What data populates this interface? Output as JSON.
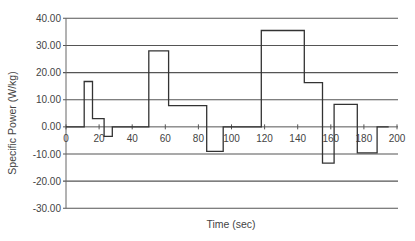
{
  "chart_data": {
    "type": "line",
    "subtype": "step",
    "title": "",
    "xlabel": "Time (sec)",
    "ylabel": "Specific Power (W/kg)",
    "xlim": [
      0,
      200
    ],
    "ylim": [
      -30,
      40
    ],
    "x_ticks": [
      0,
      20,
      40,
      60,
      80,
      100,
      120,
      140,
      160,
      180,
      200
    ],
    "x_tick_labels": [
      "0",
      "20",
      "40",
      "60",
      "80",
      "100",
      "120",
      "140",
      "160",
      "180",
      "200"
    ],
    "y_ticks": [
      40,
      30,
      20,
      10,
      0,
      -10,
      -20,
      -30
    ],
    "y_tick_labels": [
      "40.00",
      "30.00",
      "20.00",
      "10.00",
      "0.00",
      "-10.00",
      "-20.00",
      "-30.00"
    ],
    "grid": {
      "horizontal": true,
      "vertical": false
    },
    "legend": null,
    "line_color": "#333333",
    "series": [
      {
        "name": "Specific Power",
        "segments": [
          {
            "t_start": 0,
            "t_end": 11,
            "value": 0
          },
          {
            "t_start": 11,
            "t_end": 16,
            "value": 16.7
          },
          {
            "t_start": 16,
            "t_end": 23,
            "value": 3.0
          },
          {
            "t_start": 23,
            "t_end": 28,
            "value": -3.5
          },
          {
            "t_start": 28,
            "t_end": 50,
            "value": 0
          },
          {
            "t_start": 50,
            "t_end": 62,
            "value": 28.0
          },
          {
            "t_start": 62,
            "t_end": 85,
            "value": 7.8
          },
          {
            "t_start": 85,
            "t_end": 95,
            "value": -9.0
          },
          {
            "t_start": 95,
            "t_end": 118,
            "value": 0
          },
          {
            "t_start": 118,
            "t_end": 144,
            "value": 35.5
          },
          {
            "t_start": 144,
            "t_end": 155,
            "value": 16.3
          },
          {
            "t_start": 155,
            "t_end": 162,
            "value": -13.4
          },
          {
            "t_start": 162,
            "t_end": 176,
            "value": 8.3
          },
          {
            "t_start": 176,
            "t_end": 188,
            "value": -9.6
          },
          {
            "t_start": 188,
            "t_end": 195,
            "value": 0
          }
        ]
      }
    ]
  }
}
